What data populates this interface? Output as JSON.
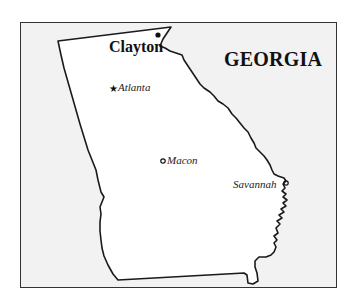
{
  "map": {
    "title": "GEORGIA",
    "background_color": "#f2f2f2",
    "state_fill": "#ffffff",
    "outline_color": "#1a1a1a",
    "places": [
      {
        "name": "Clayton",
        "marker": "filled-dot",
        "emphasis": "bold"
      },
      {
        "name": "Atlanta",
        "marker": "star",
        "emphasis": "italic",
        "note": "capital"
      },
      {
        "name": "Macon",
        "marker": "open-circle",
        "emphasis": "italic"
      },
      {
        "name": "Savannah",
        "marker": "open-circle",
        "emphasis": "italic"
      }
    ]
  }
}
